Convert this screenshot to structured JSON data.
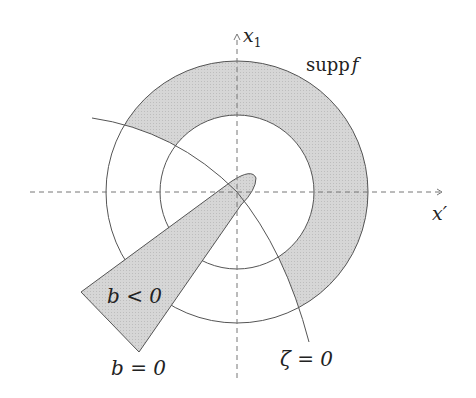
{
  "labels": {
    "x1_axis": "x",
    "x1_sub": "1",
    "xprime_axis": "x′",
    "supp_text": "supp",
    "supp_f": "f",
    "b_lt": "b < 0",
    "b_eq": "b = 0",
    "zeta_eq": "ζ = 0"
  },
  "colors": {
    "shade": "#d4d4d4",
    "stroke": "#555555",
    "axis": "#777777"
  }
}
